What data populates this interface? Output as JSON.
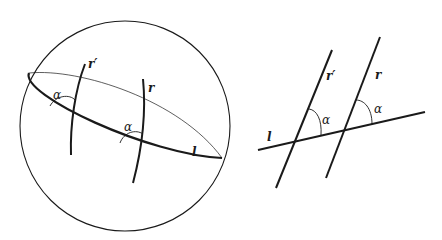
{
  "figure": {
    "left": {
      "description": "Sphere with great circle l and two curves r and r' meeting l at equal angle alpha",
      "labels": {
        "r_prime": "r′",
        "r": "r",
        "l": "l",
        "alpha1": "α",
        "alpha2": "α"
      }
    },
    "right": {
      "description": "Plane with line l crossed by parallel lines r and r' at equal angle alpha",
      "labels": {
        "r_prime": "r′",
        "r": "r",
        "l": "l",
        "alpha1": "α",
        "alpha2": "α"
      }
    },
    "colors": {
      "stroke": "#1a1a1a",
      "background": "#ffffff"
    }
  }
}
